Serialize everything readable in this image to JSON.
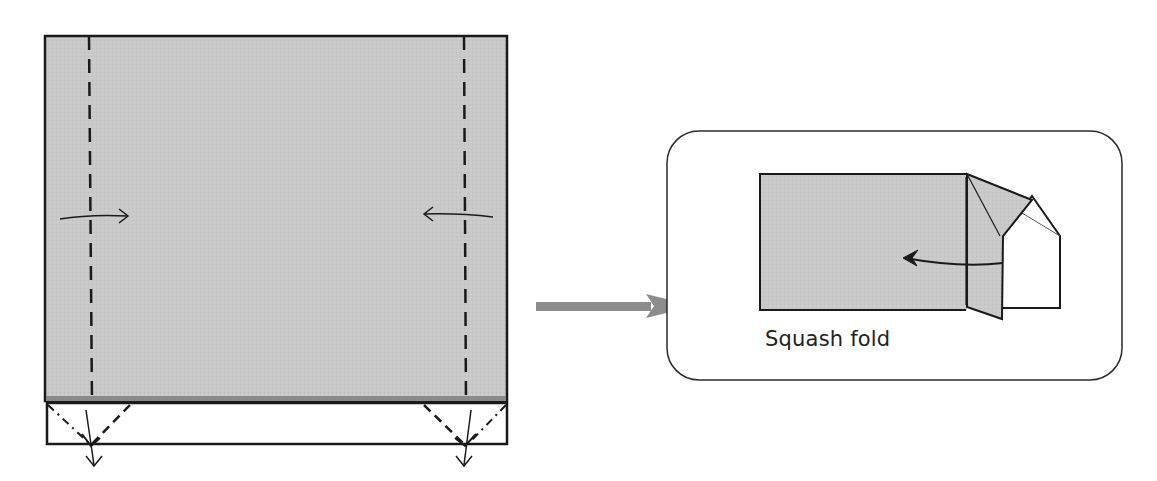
{
  "diagram": {
    "type": "origami-instruction",
    "colors": {
      "paper_fill": "#c8c8c8",
      "line": "#1a1a1a",
      "big_arrow": "#8c8c8c",
      "background": "#ffffff",
      "bottom_edge_shadow": "#8a8a8a"
    },
    "step_main": {
      "description": "Rectangle with two vertical valley-fold lines; flaps folded inward; bottom white strip with squash-fold creases and downward arrows",
      "fold_lines": [
        {
          "side": "left",
          "type": "valley",
          "direction_arrow": "right"
        },
        {
          "side": "right",
          "type": "valley",
          "direction_arrow": "left"
        }
      ],
      "bottom_arrows": [
        "down",
        "down"
      ]
    },
    "transition_arrow": "right",
    "inset": {
      "caption": "Squash fold",
      "description": "Detail of a squash fold with curved arrow pointing left"
    }
  }
}
